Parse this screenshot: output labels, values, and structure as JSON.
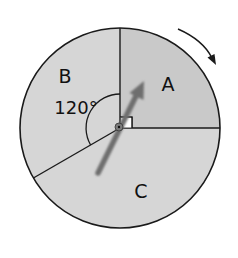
{
  "diagram": {
    "type": "spinner",
    "center": [
      120,
      128
    ],
    "radius": 100,
    "direction": "clockwise",
    "colors": {
      "sector_a": "#c9c9c9",
      "sector_b": "#d6d6d6",
      "sector_c": "#d6d6d6",
      "stroke": "#1a1a1a",
      "arrow": "#6e6e6e",
      "background": "#ffffff"
    },
    "sectors": [
      {
        "id": "A",
        "label": "A",
        "angle_deg": 90,
        "right_angle_marker": true
      },
      {
        "id": "B",
        "label": "B",
        "angle_deg": 120,
        "angle_label": "120°"
      },
      {
        "id": "C",
        "label": "C",
        "angle_deg": 150
      }
    ],
    "pointer": {
      "description": "spinner arrow pointing into sector A"
    },
    "rotation_arrow": {
      "icon": "clockwise-arrow-icon"
    }
  }
}
